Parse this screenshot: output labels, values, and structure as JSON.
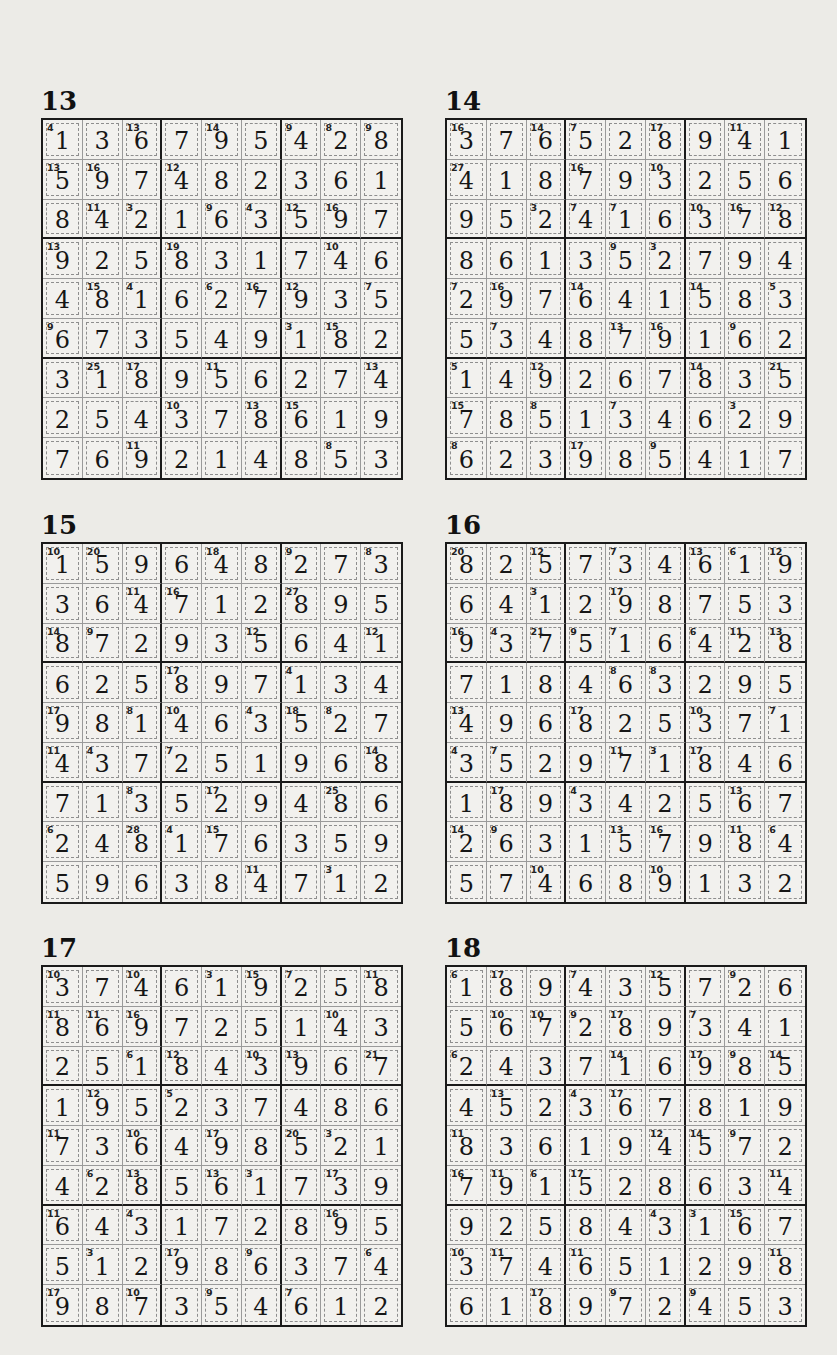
{
  "puzzles": [
    {
      "number": "13",
      "grid": [
        [
          1,
          3,
          6,
          7,
          9,
          5,
          4,
          2,
          8
        ],
        [
          5,
          9,
          7,
          4,
          8,
          2,
          3,
          6,
          1
        ],
        [
          8,
          4,
          2,
          1,
          6,
          3,
          5,
          9,
          7
        ],
        [
          9,
          2,
          5,
          8,
          3,
          1,
          7,
          4,
          6
        ],
        [
          4,
          8,
          1,
          6,
          2,
          7,
          9,
          3,
          5
        ],
        [
          6,
          7,
          3,
          5,
          4,
          9,
          1,
          8,
          2
        ],
        [
          3,
          1,
          8,
          9,
          5,
          6,
          2,
          7,
          4
        ],
        [
          2,
          5,
          4,
          3,
          7,
          8,
          6,
          1,
          9
        ],
        [
          7,
          6,
          9,
          2,
          1,
          4,
          8,
          5,
          3
        ]
      ],
      "cage_sums": [
        [
          "4",
          "",
          "13",
          "",
          "14",
          "",
          "9",
          "8",
          "9"
        ],
        [
          "13",
          "16",
          "",
          "12",
          "",
          "",
          "",
          "",
          ""
        ],
        [
          "",
          "11",
          "3",
          "",
          "9",
          "4",
          "12",
          "16",
          ""
        ],
        [
          "13",
          "",
          "",
          "19",
          "",
          "",
          "",
          "10",
          ""
        ],
        [
          "",
          "15",
          "4",
          "",
          "6",
          "16",
          "12",
          "",
          "7"
        ],
        [
          "9",
          "",
          "",
          "",
          "",
          "",
          "3",
          "15",
          ""
        ],
        [
          "",
          "25",
          "17",
          "",
          "11",
          "",
          "",
          "",
          "13"
        ],
        [
          "",
          "",
          "",
          "10",
          "",
          "13",
          "15",
          "",
          ""
        ],
        [
          "",
          "",
          "11",
          "",
          "",
          "",
          "",
          "8",
          ""
        ]
      ]
    },
    {
      "number": "14",
      "grid": [
        [
          3,
          7,
          6,
          5,
          2,
          8,
          9,
          4,
          1
        ],
        [
          4,
          1,
          8,
          7,
          9,
          3,
          2,
          5,
          6
        ],
        [
          9,
          5,
          2,
          4,
          1,
          6,
          3,
          7,
          8
        ],
        [
          8,
          6,
          1,
          3,
          5,
          2,
          7,
          9,
          4
        ],
        [
          2,
          9,
          7,
          6,
          4,
          1,
          5,
          8,
          3
        ],
        [
          5,
          3,
          4,
          8,
          7,
          9,
          1,
          6,
          2
        ],
        [
          1,
          4,
          9,
          2,
          6,
          7,
          8,
          3,
          5
        ],
        [
          7,
          8,
          5,
          1,
          3,
          4,
          6,
          2,
          9
        ],
        [
          6,
          2,
          3,
          9,
          8,
          5,
          4,
          1,
          7
        ]
      ],
      "cage_sums": [
        [
          "16",
          "",
          "14",
          "7",
          "",
          "17",
          "",
          "11",
          ""
        ],
        [
          "27",
          "",
          "",
          "16",
          "",
          "10",
          "",
          "",
          ""
        ],
        [
          "",
          "",
          "3",
          "7",
          "7",
          "",
          "10",
          "16",
          "12"
        ],
        [
          "",
          "",
          "",
          "",
          "9",
          "3",
          "",
          "",
          ""
        ],
        [
          "7",
          "16",
          "",
          "14",
          "",
          "",
          "14",
          "",
          "5"
        ],
        [
          "",
          "7",
          "",
          "",
          "13",
          "16",
          "",
          "9",
          ""
        ],
        [
          "5",
          "",
          "12",
          "",
          "",
          "",
          "14",
          "",
          "21"
        ],
        [
          "15",
          "",
          "8",
          "",
          "7",
          "",
          "",
          "3",
          ""
        ],
        [
          "8",
          "",
          "",
          "17",
          "",
          "9",
          "",
          "",
          ""
        ]
      ]
    },
    {
      "number": "15",
      "grid": [
        [
          1,
          5,
          9,
          6,
          4,
          8,
          2,
          7,
          3
        ],
        [
          3,
          6,
          4,
          7,
          1,
          2,
          8,
          9,
          5
        ],
        [
          8,
          7,
          2,
          9,
          3,
          5,
          6,
          4,
          1
        ],
        [
          6,
          2,
          5,
          8,
          9,
          7,
          1,
          3,
          4
        ],
        [
          9,
          8,
          1,
          4,
          6,
          3,
          5,
          2,
          7
        ],
        [
          4,
          3,
          7,
          2,
          5,
          1,
          9,
          6,
          8
        ],
        [
          7,
          1,
          3,
          5,
          2,
          9,
          4,
          8,
          6
        ],
        [
          2,
          4,
          8,
          1,
          7,
          6,
          3,
          5,
          9
        ],
        [
          5,
          9,
          6,
          3,
          8,
          4,
          7,
          1,
          2
        ]
      ],
      "cage_sums": [
        [
          "10",
          "20",
          "",
          "",
          "18",
          "",
          "9",
          "",
          "8"
        ],
        [
          "",
          "",
          "11",
          "16",
          "",
          "",
          "27",
          "",
          ""
        ],
        [
          "14",
          "9",
          "",
          "",
          "",
          "12",
          "",
          "",
          "12"
        ],
        [
          "",
          "",
          "",
          "17",
          "",
          "",
          "4",
          "",
          ""
        ],
        [
          "17",
          "",
          "8",
          "10",
          "",
          "4",
          "18",
          "8",
          ""
        ],
        [
          "11",
          "4",
          "",
          "7",
          "",
          "",
          "",
          "",
          "14"
        ],
        [
          "",
          "",
          "8",
          "",
          "17",
          "",
          "",
          "25",
          ""
        ],
        [
          "6",
          "",
          "28",
          "4",
          "15",
          "",
          "",
          "",
          ""
        ],
        [
          "",
          "",
          "",
          "",
          "",
          "11",
          "",
          "3",
          ""
        ]
      ]
    },
    {
      "number": "16",
      "grid": [
        [
          8,
          2,
          5,
          7,
          3,
          4,
          6,
          1,
          9
        ],
        [
          6,
          4,
          1,
          2,
          9,
          8,
          7,
          5,
          3
        ],
        [
          9,
          3,
          7,
          5,
          1,
          6,
          4,
          2,
          8
        ],
        [
          7,
          1,
          8,
          4,
          6,
          3,
          2,
          9,
          5
        ],
        [
          4,
          9,
          6,
          8,
          2,
          5,
          3,
          7,
          1
        ],
        [
          3,
          5,
          2,
          9,
          7,
          1,
          8,
          4,
          6
        ],
        [
          1,
          8,
          9,
          3,
          4,
          2,
          5,
          6,
          7
        ],
        [
          2,
          6,
          3,
          1,
          5,
          7,
          9,
          8,
          4
        ],
        [
          5,
          7,
          4,
          6,
          8,
          9,
          1,
          3,
          2
        ]
      ],
      "cage_sums": [
        [
          "20",
          "",
          "12",
          "",
          "7",
          "",
          "13",
          "6",
          "12"
        ],
        [
          "",
          "",
          "3",
          "",
          "17",
          "",
          "",
          "",
          ""
        ],
        [
          "16",
          "4",
          "21",
          "9",
          "7",
          "",
          "6",
          "11",
          "13"
        ],
        [
          "",
          "",
          "",
          "",
          "8",
          "8",
          "",
          "",
          ""
        ],
        [
          "13",
          "",
          "",
          "17",
          "",
          "",
          "10",
          "",
          "7"
        ],
        [
          "4",
          "7",
          "",
          "",
          "11",
          "3",
          "17",
          "",
          ""
        ],
        [
          "",
          "17",
          "",
          "4",
          "",
          "",
          "",
          "13",
          ""
        ],
        [
          "14",
          "9",
          "",
          "",
          "13",
          "16",
          "",
          "11",
          "6"
        ],
        [
          "",
          "",
          "10",
          "",
          "",
          "10",
          "",
          "",
          ""
        ]
      ]
    },
    {
      "number": "17",
      "grid": [
        [
          3,
          7,
          4,
          6,
          1,
          9,
          2,
          5,
          8
        ],
        [
          8,
          6,
          9,
          7,
          2,
          5,
          1,
          4,
          3
        ],
        [
          2,
          5,
          1,
          8,
          4,
          3,
          9,
          6,
          7
        ],
        [
          1,
          9,
          5,
          2,
          3,
          7,
          4,
          8,
          6
        ],
        [
          7,
          3,
          6,
          4,
          9,
          8,
          5,
          2,
          1
        ],
        [
          4,
          2,
          8,
          5,
          6,
          1,
          7,
          3,
          9
        ],
        [
          6,
          4,
          3,
          1,
          7,
          2,
          8,
          9,
          5
        ],
        [
          5,
          1,
          2,
          9,
          8,
          6,
          3,
          7,
          4
        ],
        [
          9,
          8,
          7,
          3,
          5,
          4,
          6,
          1,
          2
        ]
      ],
      "cage_sums": [
        [
          "10",
          "",
          "10",
          "",
          "3",
          "15",
          "7",
          "",
          "11"
        ],
        [
          "11",
          "11",
          "16",
          "",
          "",
          "",
          "",
          "10",
          ""
        ],
        [
          "",
          "",
          "6",
          "12",
          "",
          "10",
          "13",
          "",
          "21"
        ],
        [
          "",
          "12",
          "",
          "5",
          "",
          "",
          "",
          "",
          ""
        ],
        [
          "11",
          "",
          "10",
          "",
          "17",
          "",
          "20",
          "3",
          ""
        ],
        [
          "",
          "6",
          "13",
          "",
          "13",
          "3",
          "",
          "17",
          ""
        ],
        [
          "11",
          "",
          "4",
          "",
          "",
          "",
          "",
          "16",
          ""
        ],
        [
          "",
          "3",
          "",
          "17",
          "",
          "9",
          "",
          "",
          "6"
        ],
        [
          "17",
          "",
          "10",
          "",
          "9",
          "",
          "7",
          "",
          ""
        ]
      ]
    },
    {
      "number": "18",
      "grid": [
        [
          1,
          8,
          9,
          4,
          3,
          5,
          7,
          2,
          6
        ],
        [
          5,
          6,
          7,
          2,
          8,
          9,
          3,
          4,
          1
        ],
        [
          2,
          4,
          3,
          7,
          1,
          6,
          9,
          8,
          5
        ],
        [
          4,
          5,
          2,
          3,
          6,
          7,
          8,
          1,
          9
        ],
        [
          8,
          3,
          6,
          1,
          9,
          4,
          5,
          7,
          2
        ],
        [
          7,
          9,
          1,
          5,
          2,
          8,
          6,
          3,
          4
        ],
        [
          9,
          2,
          5,
          8,
          4,
          3,
          1,
          6,
          7
        ],
        [
          3,
          7,
          4,
          6,
          5,
          1,
          2,
          9,
          8
        ],
        [
          6,
          1,
          8,
          9,
          7,
          2,
          4,
          5,
          3
        ]
      ],
      "cage_sums": [
        [
          "6",
          "17",
          "",
          "7",
          "",
          "12",
          "",
          "9",
          ""
        ],
        [
          "",
          "10",
          "10",
          "9",
          "17",
          "",
          "7",
          "",
          ""
        ],
        [
          "6",
          "",
          "",
          "",
          "14",
          "",
          "17",
          "9",
          "14"
        ],
        [
          "",
          "13",
          "",
          "4",
          "17",
          "",
          "",
          "",
          ""
        ],
        [
          "11",
          "",
          "",
          "",
          "",
          "12",
          "14",
          "9",
          ""
        ],
        [
          "16",
          "11",
          "6",
          "17",
          "",
          "",
          "",
          "",
          "11"
        ],
        [
          "",
          "",
          "",
          "",
          "",
          "4",
          "3",
          "15",
          ""
        ],
        [
          "10",
          "11",
          "",
          "11",
          "",
          "",
          "",
          "",
          "11"
        ],
        [
          "",
          "",
          "17",
          "",
          "9",
          "",
          "9",
          "",
          ""
        ]
      ]
    }
  ]
}
